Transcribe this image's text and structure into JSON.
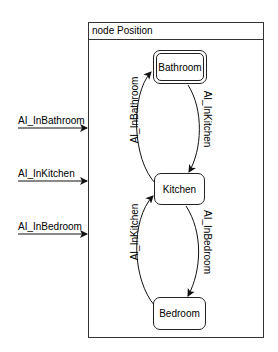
{
  "node": {
    "title": "node Position"
  },
  "states": [
    {
      "id": "bathroom",
      "label": "Bathroom",
      "initial": true
    },
    {
      "id": "kitchen",
      "label": "Kitchen",
      "initial": false
    },
    {
      "id": "bedroom",
      "label": "Bedroom",
      "initial": false
    }
  ],
  "inputs": [
    {
      "label": "AI_InBathroom"
    },
    {
      "label": "AI_InKitchen"
    },
    {
      "label": "AI_InBedroom"
    }
  ],
  "transitions": [
    {
      "from": "Kitchen",
      "to": "Bathroom",
      "label": "AI_InBathroom"
    },
    {
      "from": "Bathroom",
      "to": "Kitchen",
      "label": "AI_InKitchen"
    },
    {
      "from": "Bedroom",
      "to": "Kitchen",
      "label": "AI_InKitchen"
    },
    {
      "from": "Kitchen",
      "to": "Bedroom",
      "label": "AI_InBedroom"
    }
  ],
  "colors": {
    "stroke": "#222222",
    "background": "#ffffff"
  }
}
